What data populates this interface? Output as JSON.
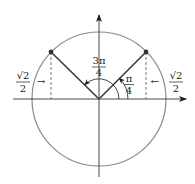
{
  "diagram": {
    "colors": {
      "circle": "#8a8a8a",
      "axis": "#1a1a1a",
      "ray": "#3a3a3a",
      "dashed": "#555555",
      "point": "#333333"
    },
    "angle_right": {
      "numerator": "π",
      "denominator": "4"
    },
    "angle_top": {
      "numerator": "3π",
      "denominator": "4"
    },
    "label_left": {
      "numerator": "√2",
      "denominator": "2",
      "arrow": "→"
    },
    "label_right": {
      "numerator": "√2",
      "denominator": "2",
      "arrow": "←"
    }
  }
}
